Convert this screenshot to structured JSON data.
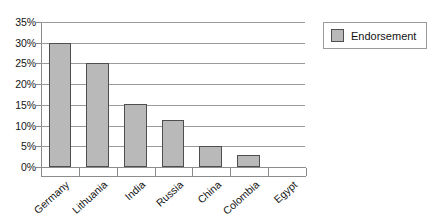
{
  "chart_data": {
    "type": "bar",
    "title": "",
    "subtitle": "",
    "xlabel": "",
    "ylabel": "",
    "categories": [
      "Germany",
      "Lithuania",
      "India",
      "Russia",
      "China",
      "Colombia",
      "Egypt"
    ],
    "series": [
      {
        "name": "Endorsement",
        "values": [
          30,
          25.2,
          15.2,
          11.3,
          5,
          3,
          0
        ],
        "color": "#b9b9b9"
      }
    ],
    "ylim": [
      0,
      35
    ],
    "ytick_values": [
      0,
      5,
      10,
      15,
      20,
      25,
      30,
      35
    ],
    "ytick_labels": [
      "0%",
      "5%",
      "10%",
      "15%",
      "20%",
      "25%",
      "30%",
      "35%"
    ],
    "grid": true,
    "grid_axis": "y",
    "legend_position": "right",
    "value_suffix": "%"
  },
  "legend": {
    "entries": [
      {
        "label": "Endorsement",
        "color": "#b9b9b9"
      }
    ]
  },
  "colors": {
    "bar_fill": "#b9b9b9",
    "bar_border": "#4e4e4e",
    "gridline": "#9a9a9a",
    "axis": "#8c8c8c",
    "text": "#131313",
    "background": "#ffffff"
  }
}
